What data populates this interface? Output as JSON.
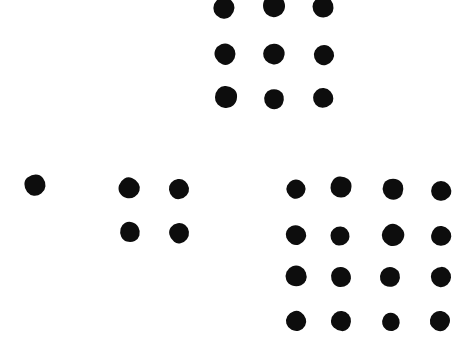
{
  "image": {
    "kind": "dot-pattern",
    "description": "Hand-drawn black dot clusters on a white background",
    "width": 474,
    "height": 352,
    "background_color": "#ffffff",
    "dot_color": "#0d0d0d",
    "total_dots": 30
  },
  "clusters": [
    {
      "name": "three-by-three-grid",
      "count": 9,
      "rows": 3,
      "cols": 3,
      "dots": [
        {
          "x": 224,
          "y": 8,
          "r": 10.5,
          "shape": "v1"
        },
        {
          "x": 274,
          "y": 6,
          "r": 11.0,
          "shape": "v2"
        },
        {
          "x": 323,
          "y": 7,
          "r": 10.5,
          "shape": "v3"
        },
        {
          "x": 225,
          "y": 54,
          "r": 10.5,
          "shape": "v4"
        },
        {
          "x": 274,
          "y": 54,
          "r": 10.5,
          "shape": "v5"
        },
        {
          "x": 324,
          "y": 55,
          "r": 10.0,
          "shape": "v1"
        },
        {
          "x": 226,
          "y": 97,
          "r": 11.0,
          "shape": "v2"
        },
        {
          "x": 274,
          "y": 99,
          "r": 10.0,
          "shape": "v3"
        },
        {
          "x": 323,
          "y": 98,
          "r": 10.0,
          "shape": "v4"
        }
      ]
    },
    {
      "name": "single-dot",
      "count": 1,
      "rows": 1,
      "cols": 1,
      "dots": [
        {
          "x": 35,
          "y": 185,
          "r": 10.5,
          "shape": "v2"
        }
      ]
    },
    {
      "name": "two-by-two-grid",
      "count": 4,
      "rows": 2,
      "cols": 2,
      "dots": [
        {
          "x": 129,
          "y": 188,
          "r": 10.5,
          "shape": "v3"
        },
        {
          "x": 179,
          "y": 189,
          "r": 10.0,
          "shape": "v1"
        },
        {
          "x": 130,
          "y": 232,
          "r": 10.0,
          "shape": "v5"
        },
        {
          "x": 179,
          "y": 233,
          "r": 10.0,
          "shape": "v4"
        }
      ]
    },
    {
      "name": "four-by-four-grid",
      "count": 16,
      "rows": 4,
      "cols": 4,
      "dots": [
        {
          "x": 296,
          "y": 189,
          "r": 9.5,
          "shape": "v1"
        },
        {
          "x": 341,
          "y": 187,
          "r": 10.5,
          "shape": "v2"
        },
        {
          "x": 393,
          "y": 189,
          "r": 10.5,
          "shape": "v3"
        },
        {
          "x": 441,
          "y": 191,
          "r": 10.0,
          "shape": "v4"
        },
        {
          "x": 296,
          "y": 235,
          "r": 10.0,
          "shape": "v5"
        },
        {
          "x": 340,
          "y": 236,
          "r": 9.5,
          "shape": "v1"
        },
        {
          "x": 393,
          "y": 235,
          "r": 11.0,
          "shape": "v2"
        },
        {
          "x": 441,
          "y": 236,
          "r": 10.0,
          "shape": "v3"
        },
        {
          "x": 296,
          "y": 276,
          "r": 10.5,
          "shape": "v4"
        },
        {
          "x": 341,
          "y": 277,
          "r": 10.0,
          "shape": "v5"
        },
        {
          "x": 390,
          "y": 277,
          "r": 10.0,
          "shape": "v1"
        },
        {
          "x": 441,
          "y": 277,
          "r": 10.0,
          "shape": "v2"
        },
        {
          "x": 296,
          "y": 321,
          "r": 10.0,
          "shape": "v3"
        },
        {
          "x": 341,
          "y": 321,
          "r": 10.0,
          "shape": "v4"
        },
        {
          "x": 391,
          "y": 322,
          "r": 9.0,
          "shape": "v5"
        },
        {
          "x": 440,
          "y": 321,
          "r": 10.0,
          "shape": "v1"
        }
      ]
    }
  ]
}
